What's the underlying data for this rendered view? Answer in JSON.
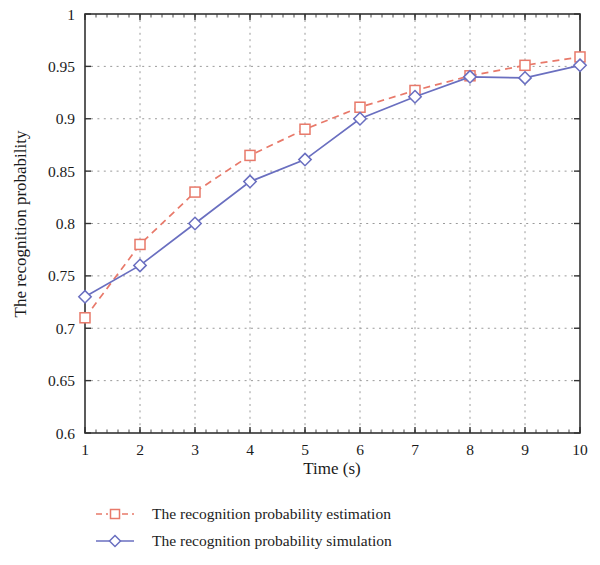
{
  "chart_data": {
    "type": "line",
    "title": "",
    "xlabel": "Time (s)",
    "ylabel": "The recognition probability",
    "x": [
      1,
      2,
      3,
      4,
      5,
      6,
      7,
      8,
      9,
      10
    ],
    "xlim": [
      1,
      10
    ],
    "ylim": [
      0.6,
      1
    ],
    "xticks": [
      "1",
      "2",
      "3",
      "4",
      "5",
      "6",
      "7",
      "8",
      "9",
      "10"
    ],
    "yticks": [
      "0.6",
      "0.65",
      "0.7",
      "0.75",
      "0.8",
      "0.85",
      "0.9",
      "0.95",
      "1"
    ],
    "ytick_values": [
      0.6,
      0.65,
      0.7,
      0.75,
      0.8,
      0.85,
      0.9,
      0.95,
      1
    ],
    "grid": true,
    "grid_style": "dotted",
    "grid_color": "#9a9a9a",
    "legend_position": "below",
    "series": [
      {
        "name": "The recognition probability estimation",
        "values": [
          0.71,
          0.78,
          0.83,
          0.865,
          0.89,
          0.911,
          0.927,
          0.941,
          0.951,
          0.959
        ],
        "color": "#E8796A",
        "line_style": "dashed",
        "marker": "square"
      },
      {
        "name": "The recognition probability simulation",
        "values": [
          0.73,
          0.76,
          0.8,
          0.84,
          0.861,
          0.9,
          0.921,
          0.94,
          0.939,
          0.951
        ],
        "color": "#6A6FC0",
        "line_style": "solid",
        "marker": "diamond"
      }
    ]
  },
  "legend": {
    "items": [
      {
        "label": "The recognition probability estimation"
      },
      {
        "label": "The recognition probability simulation"
      }
    ]
  },
  "axes": {
    "x_title": "Time (s)",
    "y_title": "The recognition probability"
  }
}
